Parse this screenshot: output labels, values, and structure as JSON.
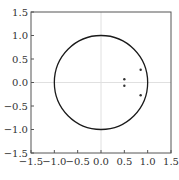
{
  "chart_data": {
    "type": "scatter",
    "title": "",
    "xlabel": "",
    "ylabel": "",
    "xlim": [
      -1.5,
      1.5
    ],
    "ylim": [
      -1.5,
      1.5
    ],
    "grid": false,
    "crosshair_lines": true,
    "xticks": [
      "-1.5",
      "-1.0",
      "-0.5",
      "0.0",
      "0.5",
      "1.0",
      "1.5"
    ],
    "yticks": [
      "1.5",
      "1.0",
      "0.5",
      "0.0",
      "-0.5",
      "-1.0",
      "-1.5"
    ],
    "unit_circle": {
      "center": [
        0,
        0
      ],
      "radius": 1.0
    },
    "series": [
      {
        "name": "points",
        "x": [
          0.5,
          0.5,
          0.85,
          0.85
        ],
        "y": [
          0.07,
          -0.07,
          0.27,
          -0.27
        ]
      }
    ],
    "colors": {
      "circle": "#1a1a1a",
      "points": "#333333",
      "axes": "#555555",
      "crosshair": "#e0e0e0"
    }
  }
}
